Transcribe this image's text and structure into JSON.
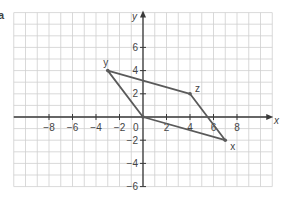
{
  "figure": {
    "part_label": "a",
    "axes": {
      "x_label": "x",
      "y_label": "y",
      "origin_label": "0",
      "x_range": [
        -11,
        11
      ],
      "y_range": [
        -6,
        9
      ],
      "x_ticks": [
        {
          "value": -8,
          "label": "−8"
        },
        {
          "value": -6,
          "label": "−6"
        },
        {
          "value": -4,
          "label": "−4"
        },
        {
          "value": -2,
          "label": "−2"
        },
        {
          "value": 2,
          "label": "2"
        },
        {
          "value": 4,
          "label": "4"
        },
        {
          "value": 6,
          "label": "6"
        },
        {
          "value": 8,
          "label": "8"
        }
      ],
      "y_ticks": [
        {
          "value": 6,
          "label": "6"
        },
        {
          "value": 4,
          "label": "4"
        },
        {
          "value": 2,
          "label": "2"
        },
        {
          "value": -2,
          "label": "−2"
        },
        {
          "value": -4,
          "label": "−4"
        },
        {
          "value": -6,
          "label": "−6"
        }
      ]
    },
    "shape": {
      "type": "quadrilateral",
      "vertices": [
        {
          "name": "origin",
          "label": "",
          "x": 0,
          "y": 0
        },
        {
          "name": "y",
          "label": "y",
          "x": -3,
          "y": 4
        },
        {
          "name": "z",
          "label": "z",
          "x": 4,
          "y": 2
        },
        {
          "name": "x",
          "label": "x",
          "x": 7,
          "y": -2
        }
      ]
    },
    "colors": {
      "grid": "#cfcfcf",
      "axes": "#3a3a3a",
      "shape": "#5a5a5a",
      "text": "#444444"
    }
  }
}
